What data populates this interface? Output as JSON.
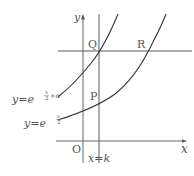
{
  "diagram": {
    "axes": {
      "x_label": "x",
      "y_label": "y",
      "origin_label": "O"
    },
    "points": {
      "P": "P",
      "Q": "Q",
      "R": "R"
    },
    "vertical_line": {
      "label_lhs": "x",
      "label_eq": "=",
      "label_rhs": "k"
    },
    "curves": {
      "upper": {
        "lhs": "y",
        "eq": "=",
        "base": "e",
        "exp_num": "x",
        "exp_den": "2",
        "exp_tail": "+α"
      },
      "lower": {
        "lhs": "y",
        "eq": "=",
        "base": "e",
        "exp_num": "x",
        "exp_den": "2"
      }
    }
  }
}
